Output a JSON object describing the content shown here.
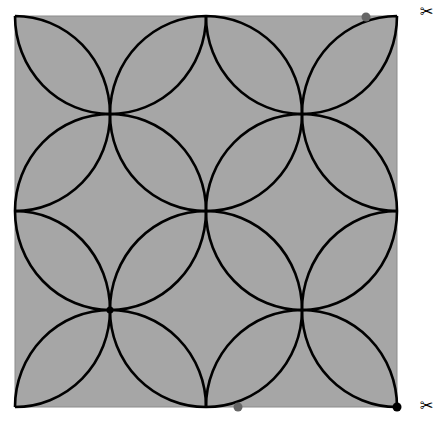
{
  "diagram": {
    "background_color": "#a6a6a6",
    "stroke_color": "#000000",
    "stroke_width": 2.6,
    "square": {
      "x": 15,
      "y": 16,
      "width": 382,
      "height": 391,
      "border_color": "#8c8c8c"
    },
    "grid_x": [
      15,
      110,
      206,
      302,
      397
    ],
    "grid_y": [
      16,
      114,
      211,
      310,
      407
    ],
    "flower_centers": [
      [
        110,
        114
      ],
      [
        302,
        114
      ],
      [
        110,
        310
      ],
      [
        302,
        310
      ]
    ],
    "markers": [
      {
        "name": "top-right-handle",
        "x": 366,
        "y": 17,
        "r": 4.5,
        "color": "#666666"
      },
      {
        "name": "bottom-middle-handle",
        "x": 238,
        "y": 407,
        "r": 4.5,
        "color": "#666666"
      },
      {
        "name": "bottom-right-corner-point",
        "x": 397,
        "y": 407,
        "r": 4.5,
        "color": "#000000"
      },
      {
        "name": "lower-left-intersection-point",
        "x": 110,
        "y": 310,
        "r": 3.5,
        "color": "#000000"
      }
    ],
    "cut_marks": [
      {
        "name": "scissors-top",
        "glyph": "✂",
        "x": 420,
        "y": 4
      },
      {
        "name": "scissors-bottom",
        "glyph": "✂",
        "x": 420,
        "y": 398
      }
    ]
  }
}
